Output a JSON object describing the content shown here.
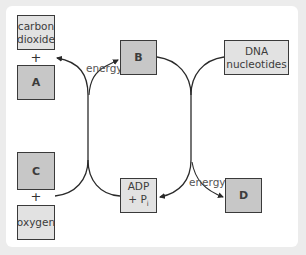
{
  "diagram": {
    "boxes": {
      "carbon_dioxide": "carbon dioxide",
      "a": "A",
      "b": "B",
      "dna_nucleotides": "DNA nucleotides",
      "c": "C",
      "oxygen": "oxygen",
      "adp_pi": "ADP + Pi",
      "adp_line1": "ADP",
      "adp_line2": "+ P",
      "adp_sub": "i",
      "d": "D"
    },
    "plus_signs": [
      "+",
      "+"
    ],
    "labels": {
      "energy_top": "energy",
      "energy_bottom": "energy"
    },
    "colors": {
      "light_box": "#e2e2e2",
      "dark_box": "#c7c7c7",
      "frame": "#ececec",
      "line": "#2a2a2a"
    }
  }
}
